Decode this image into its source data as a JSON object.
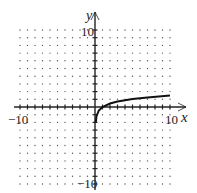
{
  "chart_data": {
    "type": "line",
    "title": "",
    "xlabel": "x",
    "ylabel": "y",
    "xlim": [
      -10,
      10
    ],
    "ylim": [
      -10,
      10
    ],
    "grid": "dotted",
    "tick_labels": {
      "x_min": "-10",
      "x_max": "10",
      "y_max": "10",
      "y_min": "-10"
    },
    "series": [
      {
        "name": "curve",
        "x": [
          0.1,
          0.2,
          0.5,
          1,
          2,
          3,
          5,
          7,
          10
        ],
        "y": [
          -2.0,
          -1.2,
          -0.45,
          0,
          0.45,
          0.7,
          1.05,
          1.25,
          1.5
        ]
      }
    ]
  },
  "labels": {
    "x_axis": "x",
    "y_axis": "y",
    "x_min": "−10",
    "x_max": "10",
    "y_max": "10",
    "y_min": "−10"
  },
  "colors": {
    "axis": "#222222",
    "curve": "#111111",
    "grid_dot": "#555555"
  }
}
